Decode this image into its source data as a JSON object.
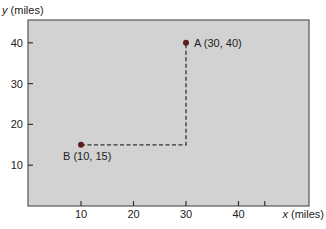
{
  "chart_data": {
    "type": "scatter",
    "title": "",
    "xlabel_var": "x",
    "xlabel_unit": "(miles)",
    "ylabel_var": "y",
    "ylabel_unit": "(miles)",
    "xlim": [
      0,
      45
    ],
    "ylim": [
      0,
      45
    ],
    "xticks": [
      10,
      20,
      30,
      40
    ],
    "yticks": [
      10,
      20,
      30,
      40
    ],
    "grid": false,
    "points": [
      {
        "name": "A",
        "x": 30,
        "y": 40,
        "label": "A (30, 40)"
      },
      {
        "name": "B",
        "x": 10,
        "y": 15,
        "label": "B (10, 15)"
      }
    ],
    "annotations": [
      {
        "type": "dashed-path",
        "from": "B",
        "corner": [
          30,
          15
        ],
        "to": "A"
      }
    ]
  },
  "colors": {
    "plot_background": "#d2d2d2",
    "axis": "#444444",
    "point": "#5a1f1a",
    "dashed_line": "#333333"
  }
}
